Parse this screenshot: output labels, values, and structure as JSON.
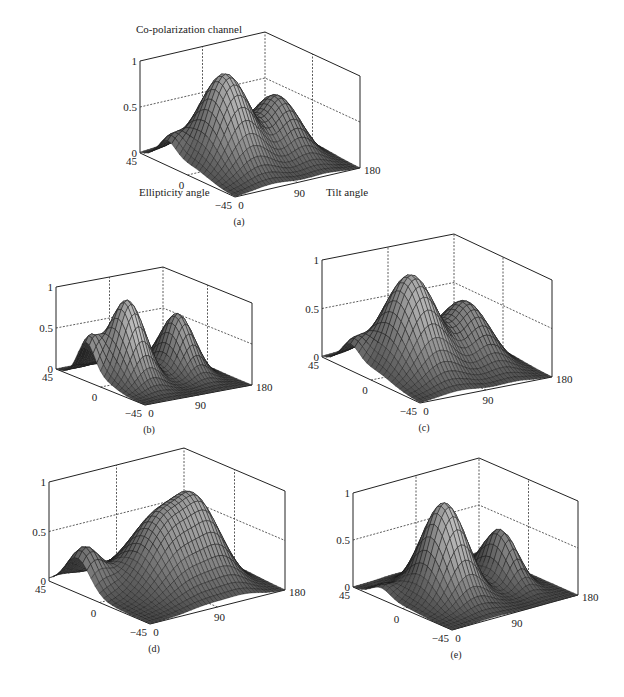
{
  "figure": {
    "title": "Co-polarization channel",
    "x_axis_label": "Tilt angle",
    "y_axis_label": "Ellipticity angle",
    "colors": {
      "axis": "#222222",
      "mesh_line": "#1a1a1a",
      "surface_dark": "#2a2a2a",
      "surface_light": "#d8d8d8",
      "background": "#ffffff"
    }
  },
  "chart_data": [
    {
      "id": "a",
      "type": "surface",
      "caption": "(a)",
      "title": "Co-polarization channel",
      "xlabel": "Tilt angle",
      "ylabel": "Ellipticity angle",
      "zlabel": "",
      "x_ticks": [
        "0",
        "90",
        "180"
      ],
      "y_ticks": [
        "45",
        "0",
        "-45"
      ],
      "z_ticks": [
        "0",
        "0.5",
        "1"
      ],
      "xlim": [
        0,
        180
      ],
      "ylim": [
        -45,
        45
      ],
      "zlim": [
        0,
        1
      ],
      "grid": true,
      "peaks": [
        {
          "tilt": 55,
          "ellipticity": 0,
          "height": 1.0,
          "tilt_width": 38,
          "ell_width": 26
        },
        {
          "tilt": 130,
          "ellipticity": 0,
          "height": 0.62,
          "tilt_width": 30,
          "ell_width": 26
        },
        {
          "tilt": 5,
          "ellipticity": 20,
          "height": 0.22,
          "tilt_width": 18,
          "ell_width": 12
        }
      ],
      "box": {
        "left": [
          140,
          153
        ],
        "front": [
          235,
          197
        ],
        "right": [
          360,
          168
        ],
        "z_height": 92
      }
    },
    {
      "id": "b",
      "type": "surface",
      "caption": "(b)",
      "x_ticks": [
        "0",
        "90",
        "180"
      ],
      "y_ticks": [
        "45",
        "0",
        "-45"
      ],
      "z_ticks": [
        "0",
        "0.5",
        "1"
      ],
      "xlim": [
        0,
        180
      ],
      "ylim": [
        -45,
        45
      ],
      "zlim": [
        0,
        1
      ],
      "grid": true,
      "peaks": [
        {
          "tilt": 45,
          "ellipticity": 0,
          "height": 1.0,
          "tilt_width": 30,
          "ell_width": 20
        },
        {
          "tilt": 130,
          "ellipticity": 0,
          "height": 0.72,
          "tilt_width": 25,
          "ell_width": 20
        },
        {
          "tilt": 5,
          "ellipticity": 15,
          "height": 0.45,
          "tilt_width": 18,
          "ell_width": 12
        }
      ],
      "box": {
        "left": [
          56,
          369
        ],
        "front": [
          145,
          405
        ],
        "right": [
          252,
          385
        ],
        "z_height": 82
      }
    },
    {
      "id": "c",
      "type": "surface",
      "caption": "(c)",
      "x_ticks": [
        "0",
        "90",
        "180"
      ],
      "y_ticks": [
        "45",
        "0",
        "-45"
      ],
      "z_ticks": [
        "0",
        "0.5",
        "1"
      ],
      "xlim": [
        0,
        180
      ],
      "ylim": [
        -45,
        45
      ],
      "zlim": [
        0,
        1
      ],
      "grid": true,
      "peaks": [
        {
          "tilt": 55,
          "ellipticity": 0,
          "height": 1.0,
          "tilt_width": 38,
          "ell_width": 26
        },
        {
          "tilt": 130,
          "ellipticity": 0,
          "height": 0.6,
          "tilt_width": 30,
          "ell_width": 26
        },
        {
          "tilt": 5,
          "ellipticity": 20,
          "height": 0.22,
          "tilt_width": 18,
          "ell_width": 12
        }
      ],
      "box": {
        "left": [
          322,
          357
        ],
        "front": [
          420,
          403
        ],
        "right": [
          552,
          377
        ],
        "z_height": 97
      }
    },
    {
      "id": "d",
      "type": "surface",
      "caption": "(d)",
      "x_ticks": [
        "0",
        "90",
        "180"
      ],
      "y_ticks": [
        "45",
        "0",
        "-45"
      ],
      "z_ticks": [
        "0",
        "0.5",
        "1"
      ],
      "xlim": [
        0,
        180
      ],
      "ylim": [
        -45,
        45
      ],
      "zlim": [
        0,
        1
      ],
      "grid": true,
      "peaks": [
        {
          "tilt": 85,
          "ellipticity": 0,
          "height": 0.75,
          "tilt_width": 45,
          "ell_width": 28
        },
        {
          "tilt": 130,
          "ellipticity": 0,
          "height": 0.55,
          "tilt_width": 28,
          "ell_width": 28
        },
        {
          "tilt": 10,
          "ellipticity": 20,
          "height": 0.42,
          "tilt_width": 22,
          "ell_width": 16
        }
      ],
      "box": {
        "left": [
          49,
          581
        ],
        "front": [
          150,
          624
        ],
        "right": [
          285,
          590
        ],
        "z_height": 99
      }
    },
    {
      "id": "e",
      "type": "surface",
      "caption": "(e)",
      "x_ticks": [
        "0",
        "90",
        "180"
      ],
      "y_ticks": [
        "45",
        "0",
        "-45"
      ],
      "z_ticks": [
        "0",
        "0.5",
        "1"
      ],
      "xlim": [
        0,
        180
      ],
      "ylim": [
        -45,
        45
      ],
      "zlim": [
        0,
        1
      ],
      "grid": true,
      "peaks": [
        {
          "tilt": 60,
          "ellipticity": 0,
          "height": 1.0,
          "tilt_width": 32,
          "ell_width": 22
        },
        {
          "tilt": 140,
          "ellipticity": 0,
          "height": 0.55,
          "tilt_width": 18,
          "ell_width": 20
        },
        {
          "tilt": 5,
          "ellipticity": 20,
          "height": 0.12,
          "tilt_width": 16,
          "ell_width": 12
        }
      ],
      "box": {
        "left": [
          353,
          587
        ],
        "front": [
          452,
          630
        ],
        "right": [
          578,
          595
        ],
        "z_height": 94
      }
    }
  ]
}
